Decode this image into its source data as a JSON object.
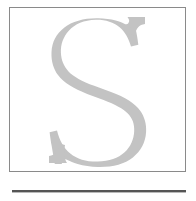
{
  "page": {
    "background_color": "#ffffff",
    "width": 196,
    "height": 201
  },
  "initial_frame": {
    "name": "drop-cap-frame",
    "border_color": "#8a8a8a",
    "border_width": 1,
    "fill_color": "#ffffff",
    "x": 9,
    "y": 7,
    "width": 177,
    "height": 165
  },
  "initial_letter": {
    "character": "S",
    "style": "serif-capital",
    "color": "#c3c3c3",
    "icon_name": "letter-s-glyph",
    "x": 57,
    "y": 25,
    "width": 76,
    "height": 129
  },
  "section_rule": {
    "name": "horizontal-rule",
    "color": "#555555",
    "shadow_color": "#b9b9b9",
    "x": 12,
    "y": 190,
    "width": 174,
    "thickness": 2
  },
  "alt_text": "Large light gray serif capital letter S inside a thin bordered box, with a horizontal rule below"
}
